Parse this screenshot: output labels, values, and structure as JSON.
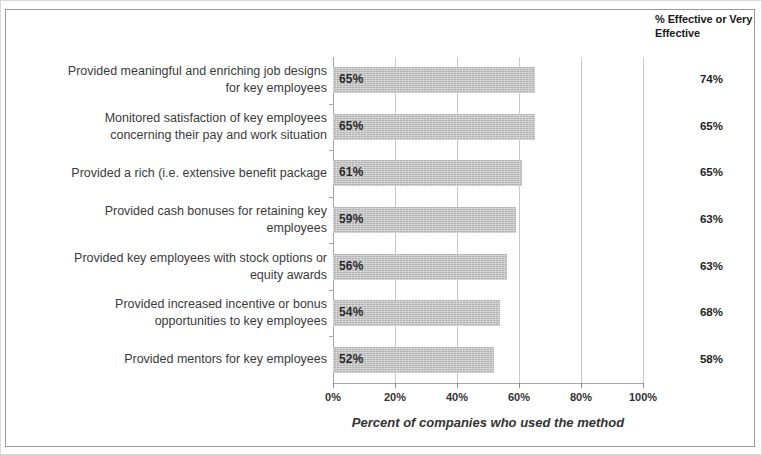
{
  "figure": {
    "effective_header": "% Effective or Very Effective",
    "axis_title": "Percent of companies who used the method"
  },
  "chart_data": {
    "type": "bar",
    "orientation": "horizontal",
    "title": "",
    "subtitle": "",
    "xlabel": "Percent of companies who used the method",
    "ylabel": "",
    "xlim": [
      0,
      100
    ],
    "xticks": [
      "0%",
      "20%",
      "40%",
      "60%",
      "80%",
      "100%"
    ],
    "xtick_values": [
      0,
      20,
      40,
      60,
      80,
      100
    ],
    "grid": true,
    "legend": "none",
    "bar_color": "#c0c0c0",
    "categories": [
      "Provided meaningful and enriching job designs for key employees",
      "Monitored satisfaction of key employees concerning their pay and work situation",
      "Provided a rich (i.e. extensive benefit package",
      "Provided cash bonuses for retaining key employees",
      "Provided key employees with stock options or equity awards",
      "Provided increased incentive or bonus opportunities to key employees",
      "Provided mentors for key employees"
    ],
    "category_lines": [
      [
        "Provided meaningful and enriching job designs",
        "for key employees"
      ],
      [
        "Monitored satisfaction of key employees",
        "concerning their pay and work situation"
      ],
      [
        "Provided a rich (i.e. extensive benefit package"
      ],
      [
        "Provided cash bonuses for retaining key",
        "employees"
      ],
      [
        "Provided key employees with stock options or",
        "equity awards"
      ],
      [
        "Provided increased incentive or bonus",
        "opportunities to key employees"
      ],
      [
        "Provided mentors for key employees"
      ]
    ],
    "values": [
      65,
      65,
      61,
      59,
      56,
      54,
      52
    ],
    "data_labels": [
      "65%",
      "65%",
      "61%",
      "59%",
      "56%",
      "54%",
      "52%"
    ],
    "secondary_column": {
      "header": "% Effective or Very Effective",
      "values": [
        74,
        65,
        65,
        63,
        63,
        68,
        58
      ],
      "labels": [
        "74%",
        "65%",
        "65%",
        "63%",
        "63%",
        "68%",
        "58%"
      ]
    }
  }
}
